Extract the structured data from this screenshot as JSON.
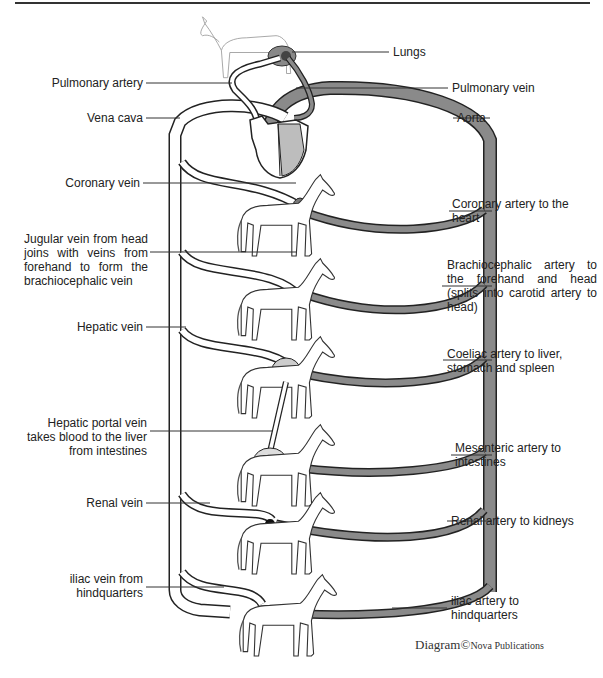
{
  "figure": {
    "type": "circulatory-system-diagram",
    "credit": {
      "main": "Diagram",
      "symbol": "©",
      "publisher": "Nova Publications"
    },
    "colors": {
      "artery": "#7a7a7a",
      "vein": "#ffffff",
      "outline": "#222222",
      "heart": "#bdbdbd"
    }
  },
  "labels": {
    "left": [
      {
        "id": "pulmonary-artery",
        "text": "Pulmonary artery"
      },
      {
        "id": "vena-cava",
        "text": "Vena cava"
      },
      {
        "id": "coronary-vein",
        "text": "Coronary vein"
      },
      {
        "id": "jugular-vein",
        "text": "Jugular vein from head joins with veins from forehand to form the brachiocephalic vein"
      },
      {
        "id": "hepatic-vein",
        "text": "Hepatic vein"
      },
      {
        "id": "hepatic-portal-vein",
        "text": "Hepatic portal vein takes blood to the liver from intestines"
      },
      {
        "id": "renal-vein",
        "text": "Renal vein"
      },
      {
        "id": "iliac-vein",
        "text": "iliac vein from hindquarters"
      }
    ],
    "right": [
      {
        "id": "lungs",
        "text": "Lungs"
      },
      {
        "id": "pulmonary-vein",
        "text": "Pulmonary vein"
      },
      {
        "id": "aorta",
        "text": "Aorta"
      },
      {
        "id": "coronary-artery",
        "text": "Coronary artery to the heart"
      },
      {
        "id": "brachiocephalic-artery",
        "text": "Brachiocephalic artery to the forehand and head (splits into carotid artery to head)"
      },
      {
        "id": "coeliac-artery",
        "text": "Coeliac artery to liver, stomach and spleen"
      },
      {
        "id": "mesenteric-artery",
        "text": "Mesenteric artery to intestines"
      },
      {
        "id": "renal-artery",
        "text": "Renal artery to kidneys"
      },
      {
        "id": "iliac-artery",
        "text": "iliac artery to hindquarters"
      }
    ]
  },
  "organs": [
    {
      "id": "lungs",
      "level": 0
    },
    {
      "id": "heart",
      "level": 1
    },
    {
      "id": "forehand-head",
      "level": 2
    },
    {
      "id": "liver-stomach-spleen",
      "level": 3
    },
    {
      "id": "intestines",
      "level": 4
    },
    {
      "id": "kidneys",
      "level": 5
    },
    {
      "id": "hindquarters",
      "level": 6
    }
  ]
}
